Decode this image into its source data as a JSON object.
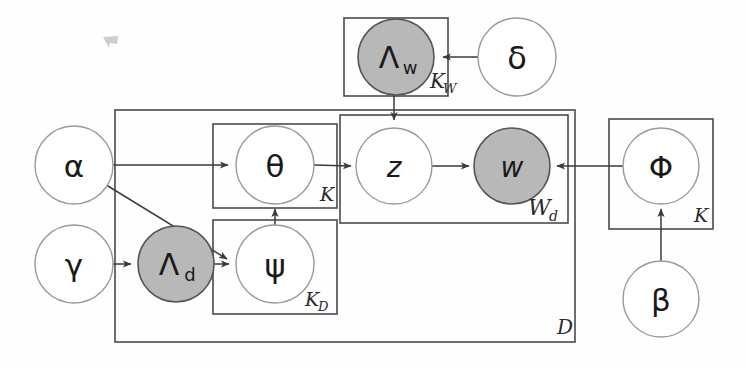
{
  "diagram": {
    "style": {
      "node_fill_observed": "#b8b8b8",
      "node_fill_latent": "#ffffff",
      "node_stroke": "#555555",
      "plate_stroke": "#4a4a4a",
      "edge_color": "#3a3a3a",
      "background": "#fefefe"
    },
    "nodes": [
      {
        "id": "lambda_w",
        "label": "Λ",
        "subscript": "w",
        "shaded": true,
        "cx": 396,
        "cy": 57,
        "r": 38
      },
      {
        "id": "delta",
        "label": "δ",
        "subscript": "",
        "shaded": false,
        "cx": 517,
        "cy": 57,
        "r": 39
      },
      {
        "id": "alpha",
        "label": "α",
        "subscript": "",
        "shaded": false,
        "cx": 74,
        "cy": 165,
        "r": 39
      },
      {
        "id": "gamma",
        "label": "γ",
        "subscript": "",
        "shaded": false,
        "cx": 74,
        "cy": 264,
        "r": 39
      },
      {
        "id": "lambda_d",
        "label": "Λ",
        "subscript": "d",
        "shaded": true,
        "cx": 176,
        "cy": 264,
        "r": 38
      },
      {
        "id": "theta",
        "label": "θ",
        "subscript": "",
        "shaded": false,
        "cx": 275,
        "cy": 165,
        "r": 39
      },
      {
        "id": "psi",
        "label": "ψ",
        "subscript": "",
        "shaded": false,
        "cx": 275,
        "cy": 264,
        "r": 39
      },
      {
        "id": "z",
        "label": "z",
        "subscript": "",
        "shaded": false,
        "cx": 394,
        "cy": 166,
        "r": 38
      },
      {
        "id": "w",
        "label": "w",
        "subscript": "",
        "shaded": true,
        "cx": 512,
        "cy": 166,
        "r": 38
      },
      {
        "id": "phi",
        "label": "Φ",
        "subscript": "",
        "shaded": false,
        "cx": 661,
        "cy": 166,
        "r": 38
      },
      {
        "id": "beta",
        "label": "β",
        "subscript": "",
        "shaded": false,
        "cx": 661,
        "cy": 299,
        "r": 38
      }
    ],
    "plates": [
      {
        "id": "plate_kw",
        "label": "K",
        "sublabel": "W",
        "x": 344,
        "y": 18,
        "w": 104,
        "h": 78,
        "label_x": 437,
        "label_y": 88
      },
      {
        "id": "plate_d",
        "label": "D",
        "sublabel": "",
        "x": 115,
        "y": 110,
        "w": 460,
        "h": 232,
        "label_x": 566,
        "label_y": 334
      },
      {
        "id": "plate_k_theta",
        "label": "K",
        "sublabel": "",
        "x": 213,
        "y": 124,
        "w": 124,
        "h": 84,
        "label_x": 327,
        "label_y": 201
      },
      {
        "id": "plate_kd",
        "label": "K",
        "sublabel": "D",
        "x": 213,
        "y": 220,
        "w": 124,
        "h": 94,
        "label_x": 320,
        "label_y": 306
      },
      {
        "id": "plate_wd",
        "label": "W",
        "sublabel": "d",
        "x": 340,
        "y": 115,
        "w": 228,
        "h": 108,
        "label_x": 530,
        "label_y": 215
      },
      {
        "id": "plate_k_phi",
        "label": "K",
        "sublabel": "",
        "x": 609,
        "y": 119,
        "w": 104,
        "h": 110,
        "label_x": 700,
        "label_y": 222
      }
    ],
    "edges": [
      {
        "id": "delta-to-lambdaw",
        "from": "delta",
        "to": "lambda_w",
        "kind": "straight"
      },
      {
        "id": "lambdaw-to-z",
        "from": "lambda_w",
        "to": "z",
        "kind": "straight"
      },
      {
        "id": "alpha-to-theta",
        "from": "alpha",
        "to": "theta",
        "kind": "straight"
      },
      {
        "id": "alpha-to-psi",
        "from": "alpha",
        "to": "psi",
        "kind": "diagonal"
      },
      {
        "id": "gamma-to-lambdad",
        "from": "gamma",
        "to": "lambda_d",
        "kind": "straight"
      },
      {
        "id": "lambdad-to-psi",
        "from": "lambda_d",
        "to": "psi",
        "kind": "straight"
      },
      {
        "id": "psi-to-theta",
        "from": "psi",
        "to": "theta",
        "kind": "straight"
      },
      {
        "id": "theta-to-z",
        "from": "theta",
        "to": "z",
        "kind": "straight"
      },
      {
        "id": "z-to-w",
        "from": "z",
        "to": "w",
        "kind": "straight"
      },
      {
        "id": "phi-to-w",
        "from": "phi",
        "to": "w",
        "kind": "straight"
      },
      {
        "id": "beta-to-phi",
        "from": "beta",
        "to": "phi",
        "kind": "straight"
      }
    ]
  }
}
